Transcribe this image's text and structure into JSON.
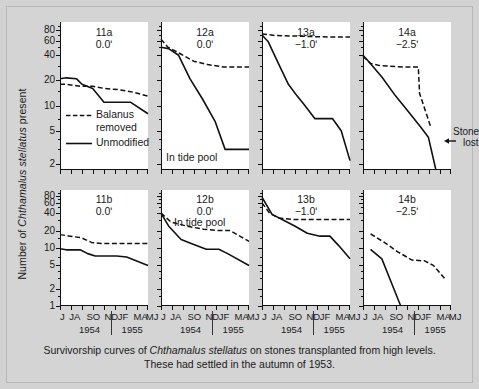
{
  "figure": {
    "y_axis_title_pre": "Number of ",
    "y_axis_title_italic": "Chthamalus stellatus",
    "y_axis_title_post": " present",
    "caption_line1_pre": "Survivorship curves of ",
    "caption_line1_italic": "Chthamalus stellatus",
    "caption_line1_post": " on stones transplanted from high levels.",
    "caption_line2": "These had settled in the autumn of 1953.",
    "background_color": "#d4d4d4",
    "plot_background_color": "#ffffff",
    "line_color": "#111111"
  },
  "legend": {
    "entries": [
      {
        "key": "dashed",
        "label_line1": "Balanus",
        "label_line2": "removed"
      },
      {
        "key": "solid",
        "label_line1": "Unmodified",
        "label_line2": ""
      }
    ]
  },
  "axes": {
    "y_label_top": "Number of Chthamalus stellatus present",
    "y_scale": "log",
    "y_ticks_top_row": [
      "80",
      "60",
      "40",
      "20",
      "10",
      "5",
      "2"
    ],
    "y_ticks_bottom_row": [
      "80",
      "60",
      "40",
      "20",
      "10",
      "5",
      "2",
      "1"
    ],
    "y_min": 1,
    "y_max": 100,
    "x_month_labels": [
      "J",
      "JA",
      "SO",
      "ND",
      "JF",
      "MA",
      "MJ"
    ],
    "x_year_left": "1954",
    "x_year_right": "1955",
    "x_tick_count": 9
  },
  "chart_data": {
    "type": "line",
    "title": "Survivorship curves of Chthamalus stellatus on stones transplanted from high levels.",
    "subtitle": "These had settled in the autumn of 1953.",
    "xlabel": "",
    "ylabel": "Number of Chthamalus stellatus present",
    "yscale": "log",
    "ylim": [
      1,
      100
    ],
    "x": [
      "J",
      "JA",
      "SO",
      "ND",
      "JF",
      "MA",
      "MJ"
    ],
    "legend": [
      "Balanus removed",
      "Unmodified"
    ],
    "legend_position": "inside panel 11a",
    "grid": false,
    "panels": [
      {
        "id": "11a",
        "label": "11a",
        "elevation": "0.0ʹ",
        "note": "",
        "row": 0,
        "col": 0,
        "y_ticks": [
          "80",
          "60",
          "40",
          "20",
          "10",
          "5",
          "2"
        ],
        "series": [
          {
            "name": "Balanus removed",
            "style": "dashed",
            "x": [
              0.0,
              0.55,
              1.6,
              2.6,
              3.6,
              4.7,
              5.8,
              7.0
            ],
            "values": [
              18,
              18,
              17,
              17,
              16,
              15.5,
              14.5,
              13
            ]
          },
          {
            "name": "Unmodified",
            "style": "solid",
            "x": [
              0.0,
              0.5,
              1.3,
              1.75,
              2.6,
              3.5,
              4.8,
              5.6,
              7.0
            ],
            "values": [
              21,
              21.5,
              21,
              18,
              16,
              11,
              11,
              11,
              8
            ]
          }
        ]
      },
      {
        "id": "12a",
        "label": "12a",
        "elevation": "0.0ʹ",
        "note": "In tide pool",
        "row": 0,
        "col": 1,
        "series": [
          {
            "name": "Balanus removed",
            "style": "dashed",
            "x": [
              0.0,
              0.55,
              1.5,
              2.6,
              3.7,
              5.0,
              7.0
            ],
            "values": [
              62,
              50,
              42,
              34,
              31,
              29,
              29
            ]
          },
          {
            "name": "Unmodified",
            "style": "solid",
            "x": [
              0.0,
              0.6,
              1.4,
              2.3,
              3.3,
              4.3,
              5.1,
              7.0
            ],
            "values": [
              50,
              48,
              40,
              21,
              12,
              6.5,
              3,
              3
            ]
          }
        ]
      },
      {
        "id": "13a",
        "label": "13a",
        "elevation": "−1.0ʹ",
        "note": "",
        "row": 0,
        "col": 2,
        "series": [
          {
            "name": "Balanus removed",
            "style": "dashed",
            "x": [
              0.0,
              1.0,
              2.5,
              4.0,
              5.5,
              7.0
            ],
            "values": [
              72,
              69,
              68,
              67,
              66,
              66
            ]
          },
          {
            "name": "Unmodified",
            "style": "solid",
            "x": [
              0.0,
              0.5,
              1.3,
              2.1,
              2.8,
              3.3,
              4.2,
              5.6,
              6.3,
              7.0
            ],
            "values": [
              70,
              58,
              32,
              18,
              13,
              10.5,
              7,
              7,
              5,
              2.2
            ]
          }
        ]
      },
      {
        "id": "14a",
        "label": "14a",
        "elevation": "−2.5ʹ",
        "note": "Stone lost",
        "row": 0,
        "col": 3,
        "series": [
          {
            "name": "Balanus removed",
            "style": "dashed",
            "x": [
              0.0,
              0.6,
              1.4,
              3.2,
              4.4,
              4.5,
              5.4
            ],
            "values": [
              39,
              32,
              30,
              29,
              29,
              14,
              5.5
            ]
          },
          {
            "name": "Unmodified",
            "style": "solid",
            "x": [
              0.0,
              0.5,
              1.5,
              2.6,
              3.6,
              4.6,
              5.2,
              5.8
            ],
            "values": [
              40,
              33,
              22,
              13,
              8.5,
              5.5,
              4.2,
              1.6
            ]
          }
        ]
      },
      {
        "id": "11b",
        "label": "11b",
        "elevation": "0.0ʹ",
        "note": "",
        "row": 1,
        "col": 0,
        "y_ticks": [
          "80",
          "60",
          "40",
          "20",
          "10",
          "5",
          "2",
          "1"
        ],
        "series": [
          {
            "name": "Balanus removed",
            "style": "dashed",
            "x": [
              0.0,
              0.8,
              1.7,
              2.5,
              3.3,
              5.0,
              7.0
            ],
            "values": [
              17,
              16,
              15,
              12.5,
              12,
              12,
              12
            ]
          },
          {
            "name": "Unmodified",
            "style": "solid",
            "x": [
              0.0,
              0.5,
              1.6,
              2.2,
              2.8,
              4.5,
              5.3,
              7.0
            ],
            "values": [
              9.7,
              9.3,
              9.3,
              8.0,
              7.3,
              7.3,
              7.0,
              5.0
            ]
          }
        ]
      },
      {
        "id": "12b",
        "label": "12b",
        "elevation": "0.0ʹ",
        "note": "In tide pool",
        "row": 1,
        "col": 1,
        "series": [
          {
            "name": "Balanus removed",
            "style": "dashed",
            "x": [
              0.0,
              0.8,
              2.0,
              3.4,
              4.6,
              5.5,
              7.0
            ],
            "values": [
              40,
              28,
              24,
              21,
              20,
              20,
              13
            ]
          },
          {
            "name": "Unmodified",
            "style": "solid",
            "x": [
              0.0,
              0.6,
              1.6,
              2.4,
              3.6,
              4.6,
              5.3,
              7.0
            ],
            "values": [
              40,
              24,
              14,
              12,
              9.5,
              9.5,
              8.0,
              5.0
            ]
          }
        ]
      },
      {
        "id": "13b",
        "label": "13b",
        "elevation": "−1.0ʹ",
        "note": "",
        "row": 1,
        "col": 2,
        "series": [
          {
            "name": "Balanus removed",
            "style": "dashed",
            "x": [
              0.0,
              0.6,
              1.3,
              2.4,
              4.0,
              5.6,
              7.0
            ],
            "values": [
              60,
              40,
              33,
              31,
              31,
              31,
              31
            ]
          },
          {
            "name": "Unmodified",
            "style": "solid",
            "x": [
              0.0,
              0.8,
              1.6,
              2.6,
              3.6,
              4.6,
              5.4,
              6.1,
              7.0
            ],
            "values": [
              75,
              38,
              31,
              24,
              18,
              16,
              16,
              11,
              6.5
            ]
          }
        ]
      },
      {
        "id": "14b",
        "label": "14b",
        "elevation": "−2.5ʹ",
        "note": "",
        "row": 1,
        "col": 3,
        "series": [
          {
            "name": "Balanus removed",
            "style": "dashed",
            "x": [
              0.6,
              1.7,
              2.8,
              3.9,
              4.9,
              5.6,
              6.6
            ],
            "values": [
              17.5,
              12.5,
              8.5,
              6.2,
              6.0,
              5.0,
              2.8
            ]
          },
          {
            "name": "Unmodified",
            "style": "solid",
            "x": [
              0.6,
              1.5,
              2.3,
              3.0
            ],
            "values": [
              9.5,
              6.5,
              2.4,
              1.0
            ]
          }
        ]
      }
    ]
  }
}
